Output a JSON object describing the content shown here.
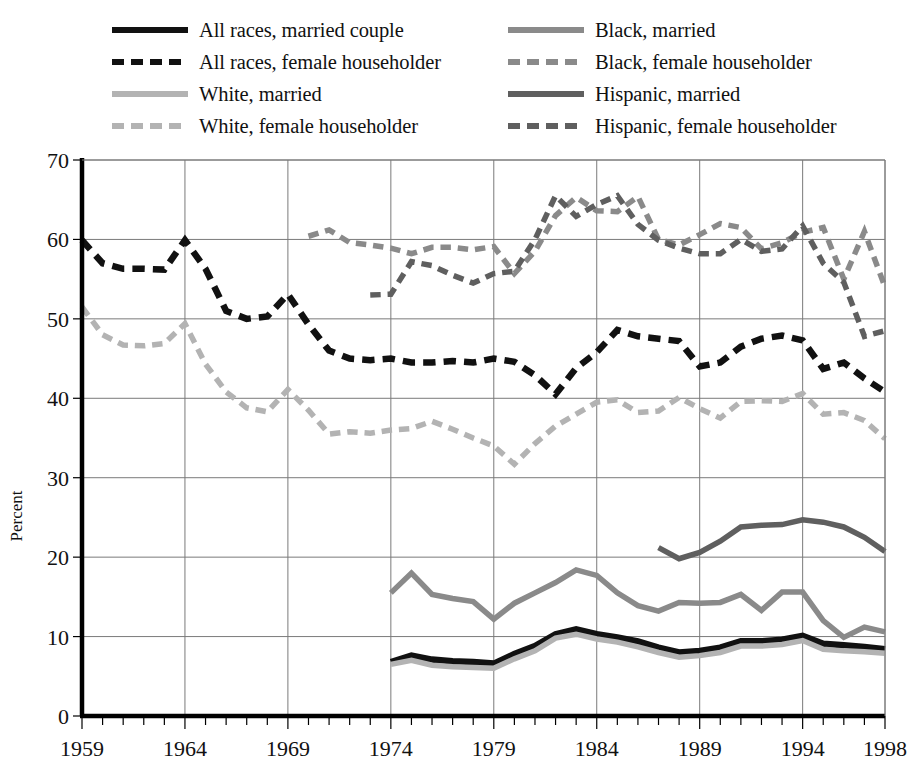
{
  "legend": {
    "columns": [
      {
        "entries": [
          {
            "label": "All races, married couple",
            "key": "all_married",
            "color": "#111111",
            "style": "solid",
            "width": 6.5
          },
          {
            "label": "All races, female householder",
            "key": "all_female",
            "color": "#111111",
            "style": "dashed",
            "width": 6.5
          },
          {
            "label": "White, married",
            "key": "white_married",
            "color": "#b3b3b3",
            "style": "solid",
            "width": 5.5
          },
          {
            "label": "White, female householder",
            "key": "white_female",
            "color": "#b3b3b3",
            "style": "dashed",
            "width": 5.5
          }
        ]
      },
      {
        "entries": [
          {
            "label": "Black, married",
            "key": "black_married",
            "color": "#8a8a8a",
            "style": "solid",
            "width": 5.5
          },
          {
            "label": "Black, female householder",
            "key": "black_female",
            "color": "#8a8a8a",
            "style": "dashed",
            "width": 5.5
          },
          {
            "label": "Hispanic, married",
            "key": "hispanic_married",
            "color": "#5f5f5f",
            "style": "solid",
            "width": 5.5
          },
          {
            "label": "Hispanic, female householder",
            "key": "hispanic_female",
            "color": "#5f5f5f",
            "style": "dashed",
            "width": 5.5
          }
        ]
      }
    ]
  },
  "chart_data": {
    "type": "line",
    "title": "",
    "xlabel": "",
    "ylabel": "Percent",
    "xlim": [
      1959,
      1998
    ],
    "ylim": [
      0,
      70
    ],
    "ytick_step": 10,
    "yticks": [
      0,
      10,
      20,
      30,
      40,
      50,
      60,
      70
    ],
    "xticks": [
      1959,
      1964,
      1969,
      1974,
      1979,
      1984,
      1989,
      1994,
      1998
    ],
    "xtick_labels": [
      "1959",
      "1964",
      "1969",
      "1974",
      "1979",
      "1984",
      "1989",
      "1994",
      "1998"
    ],
    "xminor_step": 1,
    "grid": "both",
    "legend_position": "above",
    "series": [
      {
        "name": "All races, married couple",
        "key": "all_married",
        "color": "#111111",
        "style": "solid",
        "width": 6.5,
        "x": [
          1974,
          1975,
          1976,
          1977,
          1978,
          1979,
          1980,
          1981,
          1982,
          1983,
          1984,
          1985,
          1986,
          1987,
          1988,
          1989,
          1990,
          1991,
          1992,
          1993,
          1994,
          1995,
          1996,
          1997,
          1998
        ],
        "values": [
          6.8,
          7.6,
          7.1,
          6.9,
          6.8,
          6.6,
          7.8,
          8.8,
          10.3,
          10.9,
          10.3,
          9.9,
          9.4,
          8.6,
          8.0,
          8.2,
          8.6,
          9.4,
          9.4,
          9.6,
          10.1,
          9.1,
          8.9,
          8.7,
          8.4
        ]
      },
      {
        "name": "All races, female householder",
        "key": "all_female",
        "color": "#111111",
        "style": "dashed",
        "width": 6.5,
        "x": [
          1959,
          1960,
          1961,
          1962,
          1963,
          1964,
          1965,
          1966,
          1967,
          1968,
          1969,
          1970,
          1971,
          1972,
          1973,
          1974,
          1975,
          1976,
          1977,
          1978,
          1979,
          1980,
          1981,
          1982,
          1983,
          1984,
          1985,
          1986,
          1987,
          1988,
          1989,
          1990,
          1991,
          1992,
          1993,
          1994,
          1995,
          1996,
          1997,
          1998
        ],
        "values": [
          59.9,
          57.0,
          56.3,
          56.3,
          56.2,
          59.9,
          56.3,
          51.0,
          50.0,
          50.3,
          53.1,
          49.3,
          46.0,
          45.0,
          44.8,
          45.0,
          44.5,
          44.5,
          44.7,
          44.5,
          45.0,
          44.6,
          42.9,
          40.5,
          43.8,
          45.8,
          48.6,
          47.8,
          47.5,
          47.2,
          44.0,
          44.5,
          46.5,
          47.5,
          47.9,
          47.3,
          43.7,
          44.5,
          42.5,
          40.8
        ]
      },
      {
        "name": "White, married",
        "key": "white_married",
        "color": "#b3b3b3",
        "style": "solid",
        "width": 5.5,
        "x": [
          1974,
          1975,
          1976,
          1977,
          1978,
          1979,
          1980,
          1981,
          1982,
          1983,
          1984,
          1985,
          1986,
          1987,
          1988,
          1989,
          1990,
          1991,
          1992,
          1993,
          1994,
          1995,
          1996,
          1997,
          1998
        ],
        "values": [
          6.5,
          7.0,
          6.4,
          6.2,
          6.1,
          6.0,
          7.2,
          8.2,
          9.8,
          10.3,
          9.7,
          9.3,
          8.7,
          8.0,
          7.4,
          7.6,
          8.0,
          8.8,
          8.8,
          9.0,
          9.5,
          8.4,
          8.2,
          8.1,
          7.9
        ]
      },
      {
        "name": "White, female householder",
        "key": "white_female",
        "color": "#b3b3b3",
        "style": "dashed",
        "width": 5.5,
        "x": [
          1959,
          1960,
          1961,
          1962,
          1963,
          1964,
          1965,
          1966,
          1967,
          1968,
          1969,
          1970,
          1971,
          1972,
          1973,
          1974,
          1975,
          1976,
          1977,
          1978,
          1979,
          1980,
          1981,
          1982,
          1983,
          1984,
          1985,
          1986,
          1987,
          1988,
          1989,
          1990,
          1991,
          1992,
          1993,
          1994,
          1995,
          1996,
          1997,
          1998
        ],
        "values": [
          51.5,
          48.0,
          46.7,
          46.6,
          46.9,
          49.4,
          44.3,
          40.8,
          38.8,
          38.3,
          41.1,
          38.5,
          35.5,
          35.8,
          35.6,
          36.0,
          36.2,
          37.1,
          36.1,
          35.0,
          34.0,
          31.7,
          34.3,
          36.5,
          38.0,
          39.5,
          39.8,
          38.2,
          38.4,
          40.1,
          38.7,
          37.5,
          39.6,
          39.7,
          39.6,
          40.6,
          38.0,
          38.2,
          37.2,
          34.9
        ]
      },
      {
        "name": "Black, married",
        "key": "black_married",
        "color": "#8a8a8a",
        "style": "solid",
        "width": 5.5,
        "x": [
          1974,
          1975,
          1976,
          1977,
          1978,
          1979,
          1980,
          1981,
          1982,
          1983,
          1984,
          1985,
          1986,
          1987,
          1988,
          1989,
          1990,
          1991,
          1992,
          1993,
          1994,
          1995,
          1996,
          1997,
          1998
        ],
        "values": [
          15.5,
          18.0,
          15.3,
          14.8,
          14.4,
          12.2,
          14.2,
          15.5,
          16.8,
          18.4,
          17.7,
          15.5,
          13.9,
          13.2,
          14.3,
          14.2,
          14.3,
          15.3,
          13.3,
          15.6,
          15.6,
          12.0,
          9.9,
          11.2,
          10.6
        ]
      },
      {
        "name": "Black, female householder",
        "key": "black_female",
        "color": "#8a8a8a",
        "style": "dashed",
        "width": 5.5,
        "x": [
          1970,
          1971,
          1972,
          1973,
          1974,
          1975,
          1976,
          1977,
          1978,
          1979,
          1980,
          1981,
          1982,
          1983,
          1984,
          1985,
          1986,
          1987,
          1988,
          1989,
          1990,
          1991,
          1992,
          1993,
          1994,
          1995,
          1996,
          1997,
          1998
        ],
        "values": [
          60.4,
          61.2,
          59.6,
          59.3,
          58.9,
          58.2,
          59.0,
          59.0,
          58.7,
          59.1,
          55.7,
          58.5,
          63.0,
          65.3,
          63.6,
          63.5,
          65.4,
          60.0,
          59.3,
          60.6,
          62.0,
          61.5,
          58.8,
          59.6,
          60.9,
          61.5,
          55.0,
          61.0,
          54.0
        ]
      },
      {
        "name": "Hispanic, married",
        "key": "hispanic_married",
        "color": "#5f5f5f",
        "style": "solid",
        "width": 5.5,
        "x": [
          1987,
          1988,
          1989,
          1990,
          1991,
          1992,
          1993,
          1994,
          1995,
          1996,
          1997,
          1998
        ],
        "values": [
          21.2,
          19.8,
          20.6,
          22.0,
          23.8,
          24.0,
          24.1,
          24.7,
          24.4,
          23.8,
          22.5,
          20.7
        ]
      },
      {
        "name": "Hispanic, female householder",
        "key": "hispanic_female",
        "color": "#5f5f5f",
        "style": "dashed",
        "width": 5.5,
        "x": [
          1973,
          1974,
          1975,
          1976,
          1977,
          1978,
          1979,
          1980,
          1981,
          1982,
          1983,
          1984,
          1985,
          1986,
          1987,
          1988,
          1989,
          1990,
          1991,
          1992,
          1993,
          1994,
          1995,
          1996,
          1997,
          1998
        ],
        "values": [
          53.0,
          53.1,
          57.2,
          56.7,
          55.5,
          54.5,
          55.7,
          56.0,
          60.0,
          65.5,
          62.9,
          64.4,
          65.5,
          61.9,
          59.9,
          58.9,
          58.2,
          58.2,
          60.0,
          58.5,
          58.8,
          61.7,
          57.0,
          54.6,
          47.8,
          48.5
        ]
      }
    ]
  }
}
